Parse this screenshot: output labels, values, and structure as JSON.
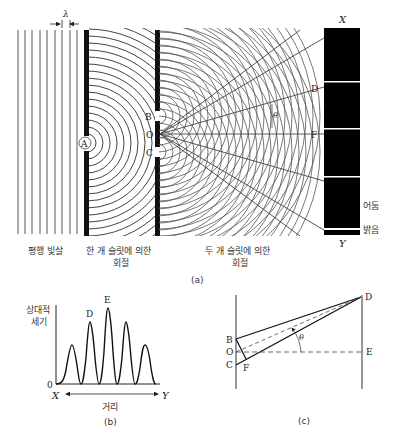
{
  "panel_a": {
    "caption": "(a)",
    "wavelength_symbol": "λ",
    "slit_single": "A",
    "slit_top": "B",
    "slit_center": "O",
    "slit_bottom": "C",
    "ray_label_d": "D",
    "ray_label_f": "F",
    "angle_symbol": "θ",
    "screen_top": "X",
    "screen_bottom": "Y",
    "dark_label": "어둠",
    "bright_label": "밝음",
    "label_plane_wave": "평행 빛살",
    "label_single_line1": "한 개 슬릿에 의한",
    "label_single_line2": "회절",
    "label_double_line1": "두 개 슬릿에 의한",
    "label_double_line2": "회절",
    "bright_fringe_y": [
      82,
      129,
      177,
      229
    ]
  },
  "panel_b": {
    "caption": "(b)",
    "ylabel_line1": "상대적",
    "ylabel_line2": "세기",
    "zero_label": "0",
    "x_start": "X",
    "x_end": "Y",
    "xlabel": "거리",
    "peak_d": "D",
    "peak_e": "E",
    "peaks_relative": [
      0.55,
      0.83,
      1.0,
      0.83,
      0.55
    ]
  },
  "panel_c": {
    "caption": "(c)",
    "point_b": "B",
    "point_o": "O",
    "point_c": "C",
    "point_f": "F",
    "point_d": "D",
    "point_e": "E",
    "angle": "θ"
  }
}
